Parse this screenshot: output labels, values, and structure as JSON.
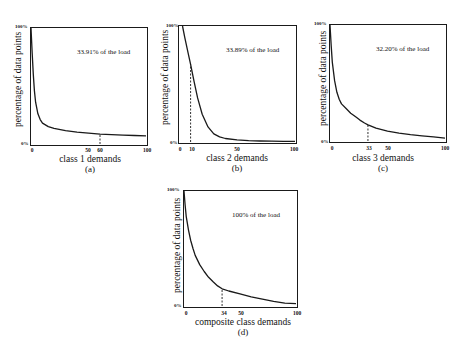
{
  "chart_data": [
    {
      "id": "a",
      "type": "line",
      "annotation": "33.91% of the load",
      "xlabel": "class 1 demands",
      "sublabel": "(a)",
      "ylabel": "percentage of data points",
      "yticks": [
        "100%",
        "0%"
      ],
      "xticks": [
        {
          "label": "0",
          "value": 0
        },
        {
          "label": "50",
          "value": 50
        },
        {
          "label": "60",
          "value": 60
        },
        {
          "label": "100",
          "value": 100
        }
      ],
      "marker_x": 60,
      "xlim": [
        0,
        100
      ],
      "ylim": [
        0,
        100
      ],
      "x": [
        0,
        1,
        2,
        3,
        4,
        6,
        8,
        10,
        15,
        20,
        30,
        40,
        50,
        60,
        70,
        80,
        90,
        100
      ],
      "y": [
        100,
        78,
        60,
        46,
        36,
        26,
        21,
        18,
        15,
        13.5,
        11.5,
        10.2,
        9.3,
        8.5,
        8.0,
        7.6,
        7.3,
        7.0
      ],
      "grid": false
    },
    {
      "id": "b",
      "type": "line",
      "annotation": "33.89% of the load",
      "xlabel": "class 2 demands",
      "sublabel": "(b)",
      "ylabel": "percentage of data points",
      "yticks": [
        "100%",
        "0%"
      ],
      "xticks": [
        {
          "label": "0",
          "value": 0
        },
        {
          "label": "10",
          "value": 10
        },
        {
          "label": "50",
          "value": 50
        },
        {
          "label": "100",
          "value": 100
        }
      ],
      "marker_x": 10,
      "xlim": [
        0,
        100
      ],
      "ylim": [
        0,
        100
      ],
      "x": [
        3,
        5,
        8,
        10,
        13,
        16,
        20,
        25,
        30,
        35,
        40,
        50,
        60,
        70,
        80,
        90,
        100
      ],
      "y": [
        100,
        90,
        76,
        67,
        52,
        38,
        24,
        13,
        7,
        4.5,
        3,
        1.8,
        1.2,
        0.9,
        0.7,
        0.6,
        0.5
      ],
      "grid": false
    },
    {
      "id": "c",
      "type": "line",
      "annotation": "32.20% of the load",
      "xlabel": "class 3 demands",
      "sublabel": "(c)",
      "ylabel": "percentage of data points",
      "yticks": [
        "100%",
        "0%"
      ],
      "xticks": [
        {
          "label": "0",
          "value": 0
        },
        {
          "label": "33",
          "value": 33
        },
        {
          "label": "50",
          "value": 50
        },
        {
          "label": "100",
          "value": 100
        }
      ],
      "marker_x": 33,
      "xlim": [
        0,
        100
      ],
      "ylim": [
        0,
        100
      ],
      "x": [
        0,
        1,
        2,
        4,
        6,
        8,
        10,
        14,
        18,
        22,
        26,
        30,
        33,
        40,
        50,
        60,
        70,
        80,
        90,
        100
      ],
      "y": [
        100,
        82,
        68,
        52,
        42,
        36,
        32,
        28,
        24,
        21,
        18,
        15.5,
        14,
        11,
        8.5,
        6.8,
        5.5,
        4.5,
        3.5,
        2.5
      ],
      "grid": false
    },
    {
      "id": "d",
      "type": "line",
      "annotation": "100% of the load",
      "xlabel": "composite class demands",
      "sublabel": "(d)",
      "ylabel": "percentage of data points",
      "yticks": [
        "100%",
        "0%"
      ],
      "xticks": [
        {
          "label": "0",
          "value": 0
        },
        {
          "label": "34",
          "value": 34
        },
        {
          "label": "50",
          "value": 50
        },
        {
          "label": "100",
          "value": 100
        }
      ],
      "marker_x": 34,
      "xlim": [
        0,
        100
      ],
      "ylim": [
        0,
        100
      ],
      "x": [
        0,
        1,
        2,
        4,
        6,
        8,
        10,
        14,
        18,
        22,
        26,
        30,
        34,
        40,
        50,
        60,
        70,
        80,
        90,
        100
      ],
      "y": [
        100,
        88,
        78,
        66,
        57,
        50,
        44,
        36,
        30,
        25,
        21,
        17.5,
        15,
        13,
        10.5,
        8,
        6,
        4,
        2.5,
        2
      ],
      "grid": false
    }
  ]
}
